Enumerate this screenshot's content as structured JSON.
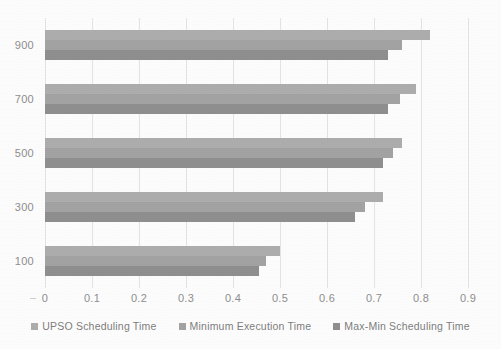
{
  "chart_data": {
    "type": "bar",
    "orientation": "horizontal",
    "title": "",
    "xlabel": "",
    "ylabel": "",
    "categories": [
      "900",
      "700",
      "500",
      "300",
      "100"
    ],
    "series": [
      {
        "name": "UPSO Scheduling Time",
        "color": "#adadad",
        "values": [
          0.82,
          0.79,
          0.76,
          0.72,
          0.5
        ]
      },
      {
        "name": "Minimum Execution Time",
        "color": "#a3a3a3",
        "values": [
          0.76,
          0.755,
          0.74,
          0.68,
          0.47
        ]
      },
      {
        "name": "Max-Min Scheduling Time",
        "color": "#8f8f8f",
        "values": [
          0.73,
          0.73,
          0.72,
          0.66,
          0.455
        ]
      }
    ],
    "xticks": [
      "0",
      "0.1",
      "0.2",
      "0.3",
      "0.4",
      "0.5",
      "0.6",
      "0.7",
      "0.8",
      "0.9"
    ],
    "xtick_values": [
      0,
      0.1,
      0.2,
      0.3,
      0.4,
      0.5,
      0.6,
      0.7,
      0.8,
      0.9
    ],
    "xlim": [
      0,
      0.9
    ],
    "yticks": [
      "900",
      "700",
      "500",
      "300",
      "100"
    ],
    "grid": true,
    "grid_axis": "x",
    "legend_position": "bottom",
    "colors": {
      "series_1": "#adadad",
      "series_2": "#a3a3a3",
      "series_3": "#8f8f8f",
      "gridline": "#e4e4e4",
      "tick_label": "#8e8e8e",
      "legend_label": "#7e7e7e",
      "background": "#fdfdfd"
    }
  },
  "legend": {
    "items": [
      {
        "label": "UPSO Scheduling Time"
      },
      {
        "label": "Minimum Execution Time"
      },
      {
        "label": "Max-Min Scheduling Time"
      }
    ]
  }
}
